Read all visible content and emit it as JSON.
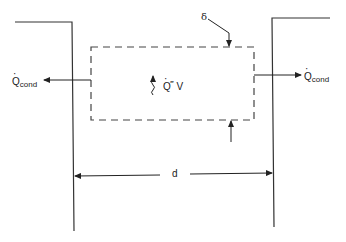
{
  "diagram": {
    "type": "heat-conduction-schematic",
    "labels": {
      "q_cond_left": {
        "symbol": "Q",
        "subscript": "cond"
      },
      "q_cond_right": {
        "symbol": "Q",
        "subscript": "cond"
      },
      "generation": {
        "symbol": "Q",
        "superscript": "‴",
        "suffix": " V"
      },
      "thickness": "δ",
      "width": "d"
    },
    "elements": [
      "left-wall",
      "right-wall",
      "dashed-control-volume",
      "left-conduction-arrow",
      "right-conduction-arrow",
      "wavy-generation-arrow",
      "delta-leader-arrow-top",
      "delta-arrow-bottom",
      "width-dimension-d"
    ],
    "colors": {
      "line": "#222222",
      "background": "#ffffff"
    }
  }
}
